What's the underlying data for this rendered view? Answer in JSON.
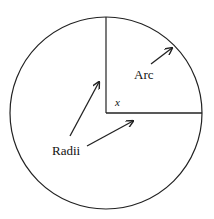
{
  "diagram": {
    "type": "circle-with-central-angle",
    "labels": {
      "arc": "Arc",
      "radii": "Radii",
      "angle": "x"
    },
    "geometry": {
      "center": [
        106,
        113
      ],
      "radius": 96,
      "angle_degrees": 90
    },
    "colors": {
      "stroke": "#222222",
      "background": "#ffffff"
    }
  }
}
